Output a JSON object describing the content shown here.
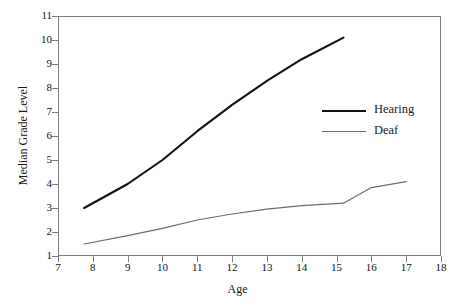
{
  "chart_data": {
    "type": "line",
    "title": "",
    "xlabel": "Age",
    "ylabel": "Median Grade Level",
    "xlim": [
      7,
      18
    ],
    "ylim": [
      1,
      11
    ],
    "xticks": [
      7,
      8,
      9,
      10,
      11,
      12,
      13,
      14,
      15,
      16,
      17,
      18
    ],
    "yticks": [
      1,
      2,
      3,
      4,
      5,
      6,
      7,
      8,
      9,
      10,
      11
    ],
    "grid": false,
    "legend_position": "upper right",
    "series": [
      {
        "name": "Hearing",
        "color": "#111111",
        "linewidth": 2.1,
        "x": [
          7.75,
          9.0,
          10.0,
          11.0,
          12.0,
          13.0,
          14.0,
          15.2
        ],
        "y": [
          3.0,
          4.0,
          5.0,
          6.2,
          7.3,
          8.3,
          9.2,
          10.1
        ]
      },
      {
        "name": "Deaf",
        "color": "#6b6b6b",
        "linewidth": 1.2,
        "x": [
          7.75,
          9.0,
          10.0,
          11.0,
          12.0,
          13.0,
          14.0,
          15.2,
          16.0,
          17.0
        ],
        "y": [
          1.5,
          1.85,
          2.15,
          2.5,
          2.75,
          2.95,
          3.1,
          3.2,
          3.85,
          4.1
        ]
      }
    ]
  },
  "axes": {
    "y_tick_labels": [
      "11",
      "10",
      "9",
      "8",
      "7",
      "6",
      "5",
      "4",
      "3",
      "2",
      "1"
    ],
    "x_tick_labels": [
      "7",
      "8",
      "9",
      "10",
      "11",
      "12",
      "13",
      "14",
      "15",
      "16",
      "17",
      "18"
    ],
    "x_title": "Age",
    "y_title": "Median Grade Level"
  },
  "legend": {
    "items": [
      {
        "label": "Hearing"
      },
      {
        "label": "Deaf"
      }
    ]
  }
}
